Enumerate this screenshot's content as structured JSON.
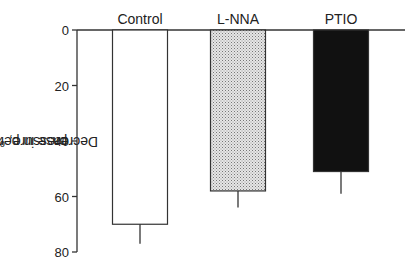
{
  "chart_data": {
    "type": "bar",
    "orientation": "vertical-inverted",
    "title": "",
    "xlabel": "",
    "ylabel": "Decrease in perfusion pressure, %",
    "ylabel_lines": [
      "Decrease in perfusion",
      "pressure, %"
    ],
    "ylim": [
      0,
      80
    ],
    "yticks": [
      0,
      20,
      40,
      60,
      80
    ],
    "categories": [
      "Control",
      "L-NNA",
      "PTIO"
    ],
    "values": [
      70,
      58,
      51
    ],
    "error_upper": [
      77,
      64,
      59
    ],
    "fills": [
      "#ffffff",
      "#d4d4d4",
      "#111111"
    ],
    "fill_patterns": [
      "none",
      "stipple",
      "solid"
    ],
    "grid": false,
    "legend": "none",
    "category_labels_position": "top"
  }
}
